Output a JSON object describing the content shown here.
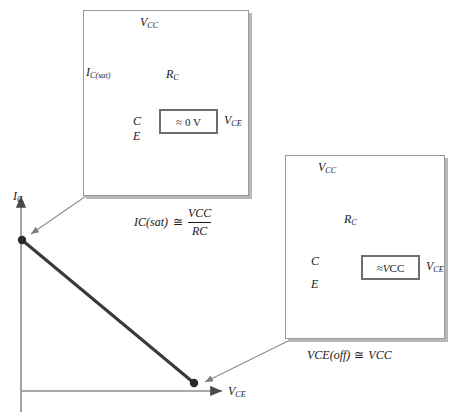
{
  "figure": {
    "axes": {
      "y_label": "IC",
      "x_label": "VCE"
    },
    "accent_color": "#3a3a3a",
    "line_color": "#9a9a9a"
  },
  "graph": {
    "load_line": {
      "saturation_point_label": "IC(sat)",
      "cutoff_point_label": "VCE(off)"
    },
    "y_axis": {
      "symbol": "I",
      "sub": "C"
    },
    "x_axis": {
      "symbol": "V",
      "sub": "CE"
    }
  },
  "panel_saturation": {
    "name": "saturation-circuit",
    "supply": {
      "symbol": "V",
      "sub": "CC"
    },
    "resistor": {
      "symbol": "R",
      "sub": "C"
    },
    "current": {
      "symbol": "I",
      "sub": "C(sat)"
    },
    "terminal_c": "C",
    "terminal_e": "E",
    "meter_reading": "≈ 0 V",
    "meter_label": {
      "symbol": "V",
      "sub": "CE"
    },
    "switch_state": "closed",
    "caption": {
      "lhs": "IC(sat)",
      "relation": "≅",
      "numerator": "VCC",
      "denominator": "RC"
    }
  },
  "panel_cutoff": {
    "name": "cutoff-circuit",
    "supply": {
      "symbol": "V",
      "sub": "CC"
    },
    "resistor": {
      "symbol": "R",
      "sub": "C"
    },
    "terminal_c": "C",
    "terminal_e": "E",
    "meter_reading_symbol": "V",
    "meter_reading_sub": "CC",
    "meter_reading_prefix": "≈",
    "meter_label": {
      "symbol": "V",
      "sub": "CE"
    },
    "switch_state": "open",
    "caption": {
      "lhs_symbol": "V",
      "lhs_sub": "CE(off)",
      "relation": "≅",
      "rhs_symbol": "V",
      "rhs_sub": "CC"
    }
  }
}
